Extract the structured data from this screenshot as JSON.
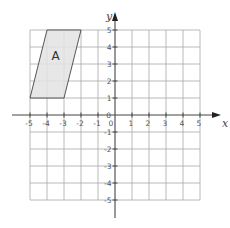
{
  "diagram": {
    "type": "coordinate-grid",
    "x_axis": {
      "label": "x",
      "min": -5,
      "max": 5,
      "ticks": [
        -5,
        -4,
        -3,
        -2,
        -1,
        0,
        1,
        2,
        3,
        4,
        5
      ]
    },
    "y_axis": {
      "label": "y",
      "min": -5,
      "max": 5,
      "ticks": [
        -5,
        -4,
        -3,
        -2,
        -1,
        0,
        1,
        2,
        3,
        4,
        5
      ]
    },
    "x_tick_labels": [
      "-5",
      "-4",
      "-3",
      "-2",
      "-1",
      "0",
      "1",
      "2",
      "3",
      "4",
      "5"
    ],
    "y_tick_labels": [
      "5",
      "4",
      "3",
      "2",
      "1",
      "-1",
      "-2",
      "-3",
      "-4",
      "-5"
    ],
    "origin_label": "0",
    "shapes": [
      {
        "name": "A",
        "label": "A",
        "kind": "parallelogram",
        "vertices": [
          [
            -5,
            1
          ],
          [
            -3,
            1
          ],
          [
            -2,
            5
          ],
          [
            -4,
            5
          ]
        ],
        "label_position": [
          -3.5,
          3.5
        ]
      }
    ],
    "colors": {
      "grid": "#a8a8a8",
      "axis": "#444444",
      "shape_fill": "#e3e3e3",
      "shape_stroke": "#555555"
    }
  }
}
